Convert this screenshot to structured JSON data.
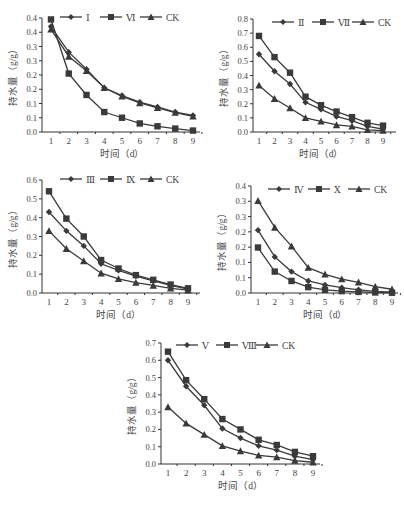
{
  "colors": {
    "line": "#3a3a3a",
    "axis": "#333333",
    "text": "#444444",
    "background": "#ffffff"
  },
  "chart_data": [
    {
      "type": "line",
      "id": "chart-1",
      "title": "",
      "xlabel": "时间（d）",
      "ylabel": "持水量（g/g）",
      "categories": [
        "1",
        "2",
        "3",
        "4",
        "5",
        "6",
        "7",
        "8",
        "9"
      ],
      "yticks": [
        "0.0",
        "0.1",
        "0.1",
        "0.2",
        "0.2",
        "0.3",
        "0.3",
        "0.4",
        "0.4"
      ],
      "ylim": [
        0,
        0.4
      ],
      "grid": false,
      "legend_position": "top",
      "series": [
        {
          "name": "Ⅰ",
          "marker": "diamond",
          "values": [
            0.37,
            0.28,
            0.22,
            0.155,
            0.128,
            0.105,
            0.088,
            0.07,
            0.058
          ]
        },
        {
          "name": "Ⅵ",
          "marker": "square",
          "values": [
            0.395,
            0.205,
            0.13,
            0.07,
            0.05,
            0.03,
            0.02,
            0.012,
            0.005
          ]
        },
        {
          "name": "CK",
          "marker": "triangle",
          "values": [
            0.36,
            0.265,
            0.215,
            0.155,
            0.125,
            0.102,
            0.085,
            0.068,
            0.055
          ]
        }
      ]
    },
    {
      "type": "line",
      "id": "chart-2",
      "title": "",
      "xlabel": "时间（d）",
      "ylabel": "持水量（g/g）",
      "categories": [
        "1",
        "2",
        "3",
        "4",
        "5",
        "6",
        "7",
        "8",
        "9"
      ],
      "yticks": [
        "0.0",
        "0.1",
        "0.2",
        "0.3",
        "0.4",
        "0.5",
        "0.6",
        "0.7",
        "0.8"
      ],
      "ylim": [
        0,
        0.8
      ],
      "grid": false,
      "legend_position": "top",
      "series": [
        {
          "name": "Ⅱ",
          "marker": "diamond",
          "values": [
            0.55,
            0.43,
            0.34,
            0.21,
            0.16,
            0.11,
            0.08,
            0.04,
            0.02
          ]
        },
        {
          "name": "Ⅶ",
          "marker": "square",
          "values": [
            0.68,
            0.53,
            0.42,
            0.25,
            0.19,
            0.145,
            0.105,
            0.065,
            0.045
          ]
        },
        {
          "name": "CK",
          "marker": "triangle",
          "values": [
            0.33,
            0.235,
            0.17,
            0.1,
            0.075,
            0.05,
            0.04,
            0.015,
            0.01
          ]
        }
      ]
    },
    {
      "type": "line",
      "id": "chart-3",
      "title": "",
      "xlabel": "时间（d）",
      "ylabel": "持水量（g/g）",
      "categories": [
        "1",
        "2",
        "3",
        "4",
        "5",
        "6",
        "7",
        "8",
        "9"
      ],
      "yticks": [
        "0.0",
        "0.1",
        "0.2",
        "0.3",
        "0.4",
        "0.5",
        "0.6"
      ],
      "ylim": [
        0,
        0.6
      ],
      "grid": false,
      "legend_position": "top",
      "series": [
        {
          "name": "Ⅲ",
          "marker": "diamond",
          "values": [
            0.43,
            0.33,
            0.25,
            0.155,
            0.12,
            0.09,
            0.065,
            0.04,
            0.02
          ]
        },
        {
          "name": "Ⅸ",
          "marker": "square",
          "values": [
            0.54,
            0.395,
            0.3,
            0.175,
            0.13,
            0.095,
            0.07,
            0.045,
            0.025
          ]
        },
        {
          "name": "CK",
          "marker": "triangle",
          "values": [
            0.33,
            0.235,
            0.17,
            0.105,
            0.075,
            0.055,
            0.04,
            0.025,
            0.015
          ]
        }
      ]
    },
    {
      "type": "line",
      "id": "chart-4",
      "title": "",
      "xlabel": "时间（d）",
      "ylabel": "持水量（g/g）",
      "categories": [
        "1",
        "2",
        "3",
        "4",
        "5",
        "6",
        "7",
        "8",
        "9"
      ],
      "yticks": [
        "0.0",
        "0.1",
        "0.1",
        "0.2",
        "0.2",
        "0.3",
        "0.3",
        "0.4"
      ],
      "ylim": [
        0,
        0.35
      ],
      "grid": false,
      "legend_position": "top",
      "series": [
        {
          "name": "Ⅳ",
          "marker": "diamond",
          "values": [
            0.235,
            0.135,
            0.08,
            0.045,
            0.03,
            0.02,
            0.012,
            0.006,
            0.003
          ]
        },
        {
          "name": "Ⅹ",
          "marker": "square",
          "values": [
            0.17,
            0.08,
            0.045,
            0.022,
            0.012,
            0.007,
            0.004,
            0.002,
            0.001
          ]
        },
        {
          "name": "CK",
          "marker": "triangle",
          "values": [
            0.345,
            0.245,
            0.175,
            0.095,
            0.07,
            0.052,
            0.04,
            0.024,
            0.014
          ]
        }
      ]
    },
    {
      "type": "line",
      "id": "chart-5",
      "title": "",
      "xlabel": "时间（d）",
      "ylabel": "持水量（g/g）",
      "categories": [
        "1",
        "2",
        "3",
        "4",
        "5",
        "6",
        "7",
        "8",
        "9"
      ],
      "yticks": [
        "0.0",
        "0.1",
        "0.2",
        "0.3",
        "0.4",
        "0.5",
        "0.6",
        "0.7"
      ],
      "ylim": [
        0,
        0.7
      ],
      "grid": false,
      "legend_position": "top",
      "series": [
        {
          "name": "Ⅴ",
          "marker": "diamond",
          "values": [
            0.6,
            0.45,
            0.34,
            0.205,
            0.15,
            0.105,
            0.08,
            0.045,
            0.025
          ]
        },
        {
          "name": "Ⅷ",
          "marker": "square",
          "values": [
            0.65,
            0.485,
            0.375,
            0.26,
            0.2,
            0.14,
            0.11,
            0.07,
            0.045
          ]
        },
        {
          "name": "CK",
          "marker": "triangle",
          "values": [
            0.33,
            0.235,
            0.17,
            0.105,
            0.075,
            0.05,
            0.04,
            0.02,
            0.01
          ]
        }
      ]
    }
  ],
  "layout": [
    {
      "left": 42,
      "top": 18,
      "right": 200,
      "bottom": 132,
      "x1": 51,
      "x9": 193,
      "yTop": 0.4,
      "legendX": 60,
      "legendY": 17
    },
    {
      "left": 253,
      "top": 19,
      "right": 396,
      "bottom": 132,
      "x1": 259,
      "x9": 383,
      "yTop": 0.8,
      "legendX": 272,
      "legendY": 22
    },
    {
      "left": 42,
      "top": 180,
      "right": 200,
      "bottom": 293,
      "x1": 49,
      "x9": 188,
      "yTop": 0.6,
      "legendX": 60,
      "legendY": 179
    },
    {
      "left": 251,
      "top": 186,
      "right": 398,
      "bottom": 293,
      "x1": 258,
      "x9": 392,
      "yTop": 0.4,
      "legendX": 268,
      "legendY": 189
    },
    {
      "left": 161,
      "top": 343,
      "right": 320,
      "bottom": 464,
      "x1": 168,
      "x9": 313,
      "yTop": 0.7,
      "legendX": 176,
      "legendY": 345
    }
  ]
}
